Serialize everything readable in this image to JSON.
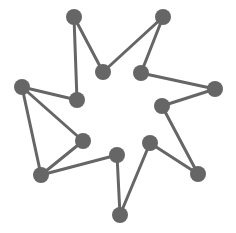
{
  "diagram": {
    "type": "network-graph",
    "color": "#666666",
    "node_radius": 8,
    "edge_width": 3,
    "nodes": [
      {
        "id": "n1",
        "x": 74,
        "y": 17
      },
      {
        "id": "n2",
        "x": 103,
        "y": 72
      },
      {
        "id": "n3",
        "x": 163,
        "y": 17
      },
      {
        "id": "n4",
        "x": 141,
        "y": 73
      },
      {
        "id": "n5",
        "x": 215,
        "y": 89
      },
      {
        "id": "n6",
        "x": 162,
        "y": 106
      },
      {
        "id": "n7",
        "x": 198,
        "y": 174
      },
      {
        "id": "n8",
        "x": 150,
        "y": 143
      },
      {
        "id": "n9",
        "x": 120,
        "y": 215
      },
      {
        "id": "n10",
        "x": 117,
        "y": 155
      },
      {
        "id": "n11",
        "x": 41,
        "y": 175
      },
      {
        "id": "n12",
        "x": 83,
        "y": 141
      },
      {
        "id": "n13",
        "x": 22,
        "y": 87
      },
      {
        "id": "n14",
        "x": 77,
        "y": 100
      }
    ],
    "edges": [
      [
        "n1",
        "n2"
      ],
      [
        "n1",
        "n14"
      ],
      [
        "n2",
        "n3"
      ],
      [
        "n3",
        "n4"
      ],
      [
        "n4",
        "n5"
      ],
      [
        "n5",
        "n6"
      ],
      [
        "n6",
        "n7"
      ],
      [
        "n7",
        "n8"
      ],
      [
        "n8",
        "n9"
      ],
      [
        "n9",
        "n10"
      ],
      [
        "n10",
        "n11"
      ],
      [
        "n11",
        "n12"
      ],
      [
        "n11",
        "n13"
      ],
      [
        "n12",
        "n13"
      ],
      [
        "n13",
        "n14"
      ]
    ]
  }
}
